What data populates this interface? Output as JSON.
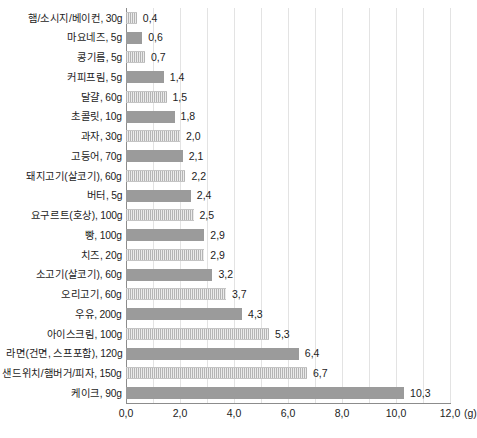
{
  "chart_data": {
    "type": "bar",
    "orientation": "horizontal",
    "title": "",
    "subtitle": "",
    "xlabel": "(g)",
    "ylabel": "",
    "xlim": [
      0.0,
      12.0
    ],
    "xticks": [
      "0,0",
      "2,0",
      "4,0",
      "6,0",
      "8,0",
      "10,0",
      "12,0"
    ],
    "xtick_values": [
      0,
      2,
      4,
      6,
      8,
      10,
      12
    ],
    "unit_label": "(g)",
    "grid": "vertical gridlines every 1.0 unit",
    "legend": "none",
    "decimal_separator": ",",
    "colors": {
      "bar_solid": "#9b9b9b",
      "bar_hatched": "#c9c9c9",
      "axis": "#8c8c8c",
      "gridline": "#e3e3e3",
      "text": "#1c1c1c",
      "background": "#ffffff"
    },
    "categories": [
      "햄/소시지/베이컨, 30g",
      "마요네즈, 5g",
      "콩기름, 5g",
      "커피프림, 5g",
      "달걀, 60g",
      "초콜릿, 10g",
      "과자, 30g",
      "고등어, 70g",
      "돼지고기(살코기), 60g",
      "버터, 5g",
      "요구르트(호상), 100g",
      "빵, 100g",
      "치즈, 20g",
      "소고기(살코기), 60g",
      "오리고기, 60g",
      "우유, 200g",
      "아이스크림, 100g",
      "라면(건면, 스프포함), 120g",
      "샌드위치/햄버거/피자, 150g",
      "케이크, 90g"
    ],
    "values": [
      0.4,
      0.6,
      0.7,
      1.4,
      1.5,
      1.8,
      2.0,
      2.1,
      2.2,
      2.4,
      2.5,
      2.9,
      2.9,
      3.2,
      3.7,
      4.3,
      5.3,
      6.4,
      6.7,
      10.3
    ],
    "value_labels": [
      "0,4",
      "0,6",
      "0,7",
      "1,4",
      "1,5",
      "1,8",
      "2,0",
      "2,1",
      "2,2",
      "2,4",
      "2,5",
      "2,9",
      "2,9",
      "3,2",
      "3,7",
      "4,3",
      "5,3",
      "6,4",
      "6,7",
      "10,3"
    ],
    "bar_styles": [
      "hatch",
      "solid",
      "hatch",
      "solid",
      "hatch",
      "solid",
      "hatch",
      "solid",
      "hatch",
      "solid",
      "hatch",
      "solid",
      "hatch",
      "solid",
      "hatch",
      "solid",
      "hatch",
      "solid",
      "hatch",
      "solid"
    ]
  }
}
